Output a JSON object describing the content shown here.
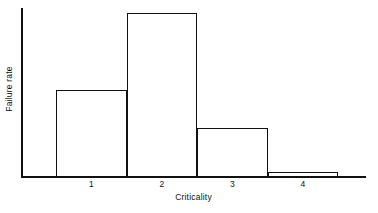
{
  "chart_data": {
    "type": "bar",
    "title": "",
    "subtitle": "",
    "xlabel": "Criticality",
    "ylabel": "Failure rate",
    "categories": [
      "1",
      "2",
      "3",
      "4"
    ],
    "tick_labels": [
      "1",
      "2",
      "3",
      "4"
    ],
    "values": [
      0.515,
      0.97,
      0.29,
      0.03
    ],
    "value_unit": "fraction of plot height (axis unlabeled)",
    "series": [
      {
        "name": "Failure rate",
        "values": [
          0.515,
          0.97,
          0.29,
          0.03
        ]
      }
    ],
    "ylim": [
      0,
      1
    ],
    "xlim": [
      0.5,
      4.5
    ],
    "y_tick_labels": [],
    "grid": false,
    "legend": false,
    "legend_position": "none",
    "bar_style": "outline-only, adjacent (histogram)",
    "annotations": [],
    "colors": {
      "axis": "#111111",
      "bar_outline": "#111111",
      "bar_fill": "transparent",
      "background": "#ffffff",
      "text": "#111111"
    }
  },
  "figure": {
    "axis_label_x": "Criticality",
    "axis_label_y": "Failure rate"
  }
}
